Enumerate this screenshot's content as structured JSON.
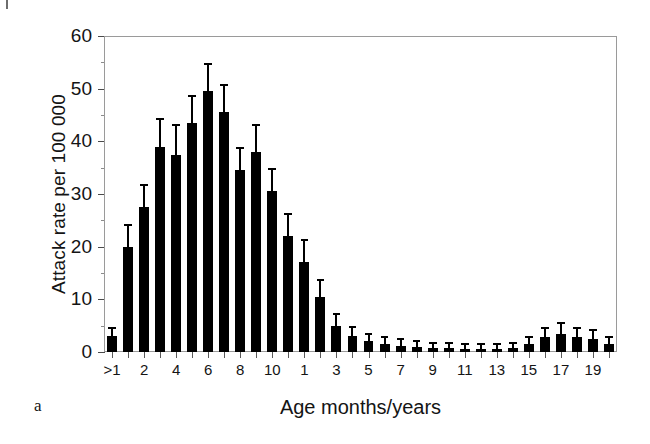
{
  "figure": {
    "panel_letter": "a",
    "background": "#ffffff",
    "bar_color": "#000000",
    "frame_color": "#9a9a9a"
  },
  "axes": {
    "y_title": "Attack rate per 100 000",
    "x_title": "Age months/years",
    "y_ticks": [
      "0",
      "10",
      "20",
      "30",
      "40",
      "50",
      "60"
    ],
    "y_minor_step": 5,
    "x_ticks": [
      ">1",
      "2",
      "4",
      "6",
      "8",
      "10",
      "1",
      "3",
      "5",
      "7",
      "9",
      "11",
      "13",
      "15",
      "17",
      "19"
    ]
  },
  "chart_data": {
    "type": "bar",
    "title": "",
    "subtitle": "",
    "xlabel": "Age months/years",
    "ylabel": "Attack rate per 100 000",
    "xlim_note": "age bins: months >1 to 11 (infants), then years 1 to 20",
    "ylim": [
      0,
      60
    ],
    "grid": false,
    "legend": "none",
    "error_bars": "95% confidence interval (vertical whiskers with caps)",
    "categories": [
      ">1",
      "1",
      "2",
      "3",
      "4",
      "5",
      "6",
      "7",
      "8",
      "9",
      "10",
      "11",
      "1",
      "2",
      "3",
      "4",
      "5",
      "6",
      "7",
      "8",
      "9",
      "10",
      "11",
      "12",
      "13",
      "14",
      "15",
      "16",
      "17",
      "18",
      "19",
      "20"
    ],
    "category_units": [
      "months",
      "months",
      "months",
      "months",
      "months",
      "months",
      "months",
      "months",
      "months",
      "months",
      "months",
      "months",
      "years",
      "years",
      "years",
      "years",
      "years",
      "years",
      "years",
      "years",
      "years",
      "years",
      "years",
      "years",
      "years",
      "years",
      "years",
      "years",
      "years",
      "years",
      "years",
      "years"
    ],
    "values": [
      3.0,
      20.0,
      27.5,
      39.0,
      37.5,
      43.5,
      49.5,
      45.5,
      34.5,
      38.0,
      30.5,
      22.0,
      17.0,
      10.5,
      5.0,
      3.0,
      2.0,
      1.5,
      1.2,
      1.0,
      0.8,
      0.7,
      0.6,
      0.6,
      0.6,
      0.7,
      1.5,
      2.8,
      3.5,
      2.8,
      2.5,
      1.5
    ],
    "error_low": [
      1.9,
      16.0,
      23.5,
      34.5,
      32.0,
      38.5,
      44.5,
      40.5,
      31.0,
      33.5,
      26.5,
      18.5,
      13.5,
      8.0,
      3.5,
      2.0,
      1.1,
      0.7,
      0.5,
      0.4,
      0.3,
      0.2,
      0.2,
      0.2,
      0.2,
      0.2,
      0.7,
      1.6,
      2.1,
      1.6,
      1.3,
      0.7
    ],
    "error_high": [
      4.3,
      24.0,
      31.5,
      44.0,
      43.0,
      48.5,
      54.5,
      50.5,
      38.5,
      43.0,
      34.5,
      26.0,
      21.0,
      13.5,
      7.0,
      4.5,
      3.2,
      2.6,
      2.2,
      1.9,
      1.6,
      1.5,
      1.3,
      1.3,
      1.3,
      1.5,
      2.6,
      4.4,
      5.3,
      4.4,
      4.0,
      2.7
    ]
  }
}
